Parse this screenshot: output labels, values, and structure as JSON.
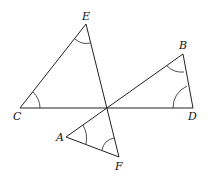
{
  "diagram": {
    "type": "geometry",
    "points": {
      "E": {
        "label": "E",
        "x": 86,
        "y": 24
      },
      "C": {
        "label": "C",
        "x": 20,
        "y": 108
      },
      "D": {
        "label": "D",
        "x": 193,
        "y": 108
      },
      "B": {
        "label": "B",
        "x": 183,
        "y": 54
      },
      "A": {
        "label": "A",
        "x": 66,
        "y": 137
      },
      "F": {
        "label": "F",
        "x": 119,
        "y": 157
      }
    },
    "labels": {
      "E": "E",
      "C": "C",
      "D": "D",
      "B": "B",
      "A": "A",
      "F": "F"
    },
    "marked_angles": [
      "E",
      "C",
      "B",
      "D",
      "A",
      "F"
    ]
  }
}
